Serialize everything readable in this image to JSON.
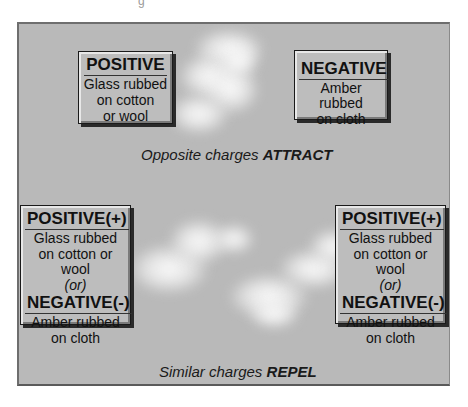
{
  "top_section": {
    "positive_box": {
      "title": "POSITIVE",
      "lines": [
        "Glass rubbed",
        "on cotton",
        "or wool"
      ]
    },
    "negative_box": {
      "title": "NEGATIVE",
      "lines": [
        "Amber rubbed",
        "on cloth"
      ]
    },
    "caption": {
      "prefix": "Opposite charges ",
      "emphasis": "ATTRACT"
    }
  },
  "bottom_section": {
    "left_box": {
      "title1": "POSITIVE(+)",
      "lines1": [
        "Glass rubbed",
        "on cotton or wool"
      ],
      "or": "(or)",
      "title2": "NEGATIVE(-)",
      "lines2": [
        "Amber rubbed",
        "on cloth"
      ]
    },
    "right_box": {
      "title1": "POSITIVE(+)",
      "lines1": [
        "Glass rubbed",
        "on cotton or wool"
      ],
      "or": "(or)",
      "title2": "NEGATIVE(-)",
      "lines2": [
        "Amber rubbed",
        "on cloth"
      ]
    },
    "caption": {
      "prefix": "Similar charges ",
      "emphasis": "REPEL"
    }
  },
  "colors": {
    "panel_bg": "#b9b9b9",
    "box_bg": "#bdbdbd",
    "text": "#111111",
    "spark": "#ffffff"
  }
}
